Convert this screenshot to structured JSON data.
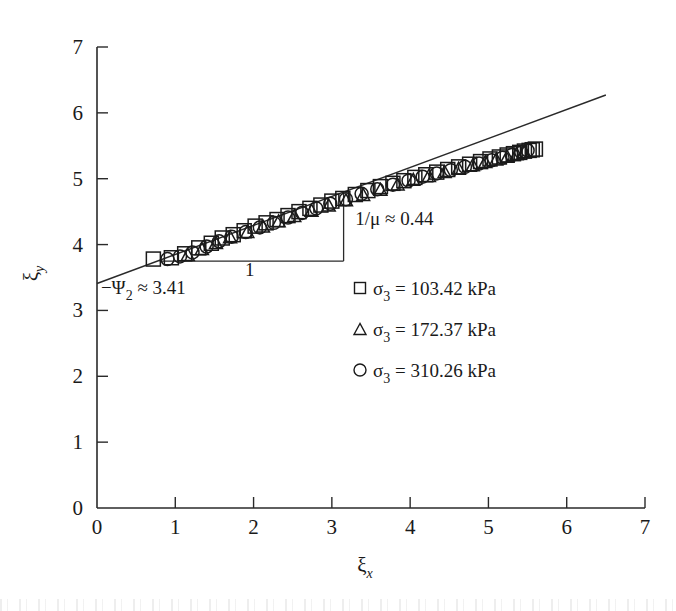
{
  "chart_data": {
    "type": "scatter",
    "title": "",
    "xlabel": "ξ_x",
    "ylabel": "ξ_y",
    "xlim": [
      0,
      7
    ],
    "ylim": [
      0,
      7
    ],
    "xticks": [
      "0",
      "1",
      "2",
      "3",
      "4",
      "5",
      "6",
      "7"
    ],
    "yticks": [
      "0",
      "1",
      "2",
      "3",
      "4",
      "5",
      "6",
      "7"
    ],
    "grid": false,
    "legend_position": "inside-lower-right",
    "series": [
      {
        "name": "σ₃ = 103.42 kPa",
        "marker": "square",
        "points": [
          [
            0.72,
            3.78
          ],
          [
            0.95,
            3.8
          ],
          [
            1.12,
            3.86
          ],
          [
            1.3,
            3.95
          ],
          [
            1.46,
            4.02
          ],
          [
            1.6,
            4.1
          ],
          [
            1.74,
            4.15
          ],
          [
            1.88,
            4.21
          ],
          [
            2.02,
            4.28
          ],
          [
            2.16,
            4.33
          ],
          [
            2.3,
            4.38
          ],
          [
            2.44,
            4.44
          ],
          [
            2.58,
            4.5
          ],
          [
            2.72,
            4.55
          ],
          [
            2.86,
            4.6
          ],
          [
            3.0,
            4.66
          ],
          [
            3.14,
            4.7
          ],
          [
            3.3,
            4.76
          ],
          [
            3.46,
            4.82
          ],
          [
            3.62,
            4.88
          ],
          [
            3.78,
            4.93
          ],
          [
            3.92,
            4.97
          ],
          [
            4.06,
            5.02
          ],
          [
            4.2,
            5.06
          ],
          [
            4.34,
            5.1
          ],
          [
            4.48,
            5.14
          ],
          [
            4.62,
            5.18
          ],
          [
            4.76,
            5.22
          ],
          [
            4.9,
            5.26
          ],
          [
            5.02,
            5.3
          ],
          [
            5.14,
            5.33
          ],
          [
            5.24,
            5.36
          ],
          [
            5.32,
            5.38
          ],
          [
            5.4,
            5.4
          ],
          [
            5.46,
            5.42
          ],
          [
            5.52,
            5.43
          ],
          [
            5.56,
            5.44
          ],
          [
            5.6,
            5.45
          ]
        ]
      },
      {
        "name": "σ₃ = 172.37 kPa",
        "marker": "triangle",
        "points": [
          [
            1.16,
            3.85
          ],
          [
            1.34,
            3.94
          ],
          [
            1.52,
            4.03
          ],
          [
            1.7,
            4.12
          ],
          [
            1.92,
            4.2
          ],
          [
            2.12,
            4.28
          ],
          [
            2.32,
            4.36
          ],
          [
            2.52,
            4.44
          ],
          [
            2.74,
            4.52
          ],
          [
            2.96,
            4.6
          ],
          [
            3.18,
            4.68
          ],
          [
            3.4,
            4.76
          ],
          [
            3.62,
            4.84
          ],
          [
            3.84,
            4.92
          ],
          [
            4.04,
            4.99
          ],
          [
            4.24,
            5.05
          ],
          [
            4.44,
            5.11
          ],
          [
            4.62,
            5.16
          ],
          [
            4.8,
            5.21
          ],
          [
            4.96,
            5.26
          ],
          [
            5.1,
            5.3
          ],
          [
            5.24,
            5.34
          ],
          [
            5.36,
            5.38
          ],
          [
            5.46,
            5.41
          ]
        ]
      },
      {
        "name": "σ₃ = 310.26 kPa",
        "marker": "circle",
        "points": [
          [
            0.9,
            3.78
          ],
          [
            1.06,
            3.82
          ],
          [
            1.22,
            3.88
          ],
          [
            1.4,
            3.97
          ],
          [
            1.56,
            4.05
          ],
          [
            1.72,
            4.12
          ],
          [
            1.9,
            4.19
          ],
          [
            2.08,
            4.26
          ],
          [
            2.26,
            4.33
          ],
          [
            2.44,
            4.41
          ],
          [
            2.62,
            4.48
          ],
          [
            2.8,
            4.55
          ],
          [
            2.98,
            4.62
          ],
          [
            3.18,
            4.69
          ],
          [
            3.38,
            4.77
          ],
          [
            3.58,
            4.84
          ],
          [
            3.78,
            4.91
          ],
          [
            3.98,
            4.97
          ],
          [
            4.16,
            5.03
          ],
          [
            4.34,
            5.08
          ],
          [
            4.52,
            5.13
          ],
          [
            4.7,
            5.18
          ],
          [
            4.88,
            5.23
          ],
          [
            5.04,
            5.28
          ],
          [
            5.18,
            5.32
          ],
          [
            5.3,
            5.36
          ],
          [
            5.42,
            5.4
          ],
          [
            5.5,
            5.43
          ]
        ]
      }
    ],
    "fit_line": {
      "intercept": 3.41,
      "slope": 0.44,
      "x_start": 0.0,
      "x_end": 6.5,
      "label_intercept": "−Ψ₂ ≈ 3.41",
      "label_slope": "1/μ ≈ 0.44"
    },
    "slope_triangle": {
      "x_left": 0.8,
      "x_right": 3.15,
      "y_base": 3.75,
      "run_label": "1",
      "rise_label": "1/μ ≈ 0.44"
    },
    "annotations": [
      {
        "text": "−Ψ₂ ≈ 3.41",
        "x": 0.05,
        "y": 3.25
      },
      {
        "text": "1/μ ≈ 0.44",
        "x": 3.3,
        "y": 4.3
      },
      {
        "text": "1",
        "x": 1.95,
        "y": 3.52
      }
    ]
  },
  "axes": {
    "x_title": "ξ",
    "x_subscript": "x",
    "y_title": "ξ",
    "y_subscript": "y",
    "x_tick_labels": [
      "0",
      "1",
      "2",
      "3",
      "4",
      "5",
      "6",
      "7"
    ],
    "y_tick_labels": [
      "0",
      "1",
      "2",
      "3",
      "4",
      "5",
      "6",
      "7"
    ]
  },
  "legend": {
    "entries": [
      {
        "marker": "square",
        "symbol": "σ",
        "subscript": "3",
        "equals": "=",
        "value": "103.42",
        "unit": "kPa"
      },
      {
        "marker": "triangle",
        "symbol": "σ",
        "subscript": "3",
        "equals": "=",
        "value": "172.37",
        "unit": "kPa"
      },
      {
        "marker": "circle",
        "symbol": "σ",
        "subscript": "3",
        "equals": "=",
        "value": "310.26",
        "unit": "kPa"
      }
    ]
  },
  "annotation_texts": {
    "intercept_main": "−Ψ",
    "intercept_sub": "2",
    "intercept_rest": "≈ 3.41",
    "slope_main": "1/μ ≈ 0.44",
    "run_label": "1"
  },
  "colors": {
    "ink": "#1a1a1a",
    "line": "#2a2a2a",
    "background": "#ffffff"
  }
}
